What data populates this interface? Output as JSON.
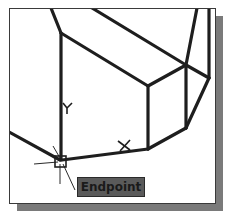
{
  "viewport": {
    "background": "#ffffff",
    "line_color": "#1e1e1e"
  },
  "snap": {
    "marker": "endpoint-square",
    "tooltip_label": "Endpoint"
  },
  "markers": {
    "y_label": "Y",
    "x_label": "X"
  }
}
